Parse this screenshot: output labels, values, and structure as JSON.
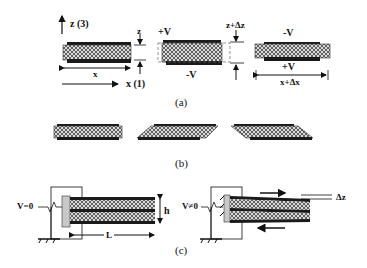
{
  "figure": {
    "panel_a": {
      "caption": "(a)",
      "axis_z": "z (3)",
      "axis_x": "x (1)",
      "dim_x": "x",
      "dim_z": "z",
      "mid_top_voltage": "+V",
      "mid_bottom_voltage": "-V",
      "dim_z_delta": "z+Δz",
      "right_top_voltage": "-V",
      "right_bottom_voltage": "+V",
      "dim_x_delta": "x+Δx"
    },
    "panel_b": {
      "caption": "(b)"
    },
    "panel_c": {
      "caption": "(c)",
      "left_voltage": "V=0",
      "thickness": "h",
      "length": "L",
      "right_voltage": "V≠0",
      "deflection": "Δz"
    },
    "colors": {
      "electrode": "#1a1a1a",
      "piezo_fill": "#9a9a9a",
      "line": "#111111"
    }
  }
}
